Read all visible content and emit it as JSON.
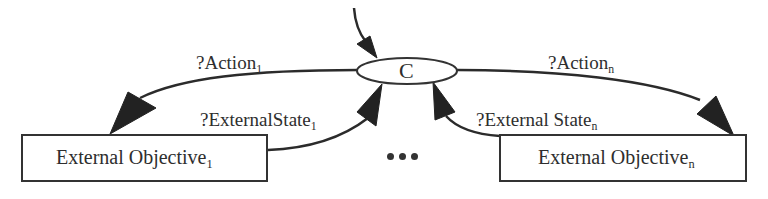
{
  "diagram": {
    "colors": {
      "line": "#2b2b2b",
      "text": "#2e2e2e",
      "background": "#ffffff"
    },
    "center_node": {
      "label": "C",
      "shape": "ellipse"
    },
    "objectives": [
      {
        "label": "External Objective",
        "subscript": "1"
      },
      {
        "label": "External Objective",
        "subscript": "n"
      }
    ],
    "edges": [
      {
        "label": "?Action",
        "subscript": "1",
        "from": "C",
        "to": "External Objective 1"
      },
      {
        "label": "?ExternalState",
        "subscript": "1",
        "from": "External Objective 1",
        "to": "C"
      },
      {
        "label": "?Action",
        "subscript": "n",
        "from": "C",
        "to": "External Objective n"
      },
      {
        "label": "?External State",
        "subscript": "n",
        "from": "External Objective n",
        "to": "C"
      },
      {
        "label": "",
        "subscript": "",
        "from": "input",
        "to": "C"
      }
    ],
    "ellipsis": "..."
  }
}
